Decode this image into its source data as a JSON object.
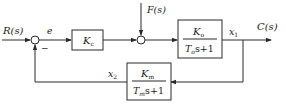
{
  "diagram": {
    "type": "control-system-block-diagram",
    "signals": {
      "input": "R(s)",
      "error": "e",
      "disturbance": "F(s)",
      "output": "C(s)",
      "x1": "x",
      "x1_sub": "1",
      "x2": "x",
      "x2_sub": "2",
      "minus_sign": "−"
    },
    "blocks": {
      "controller": {
        "num": "K",
        "num_sub": "c"
      },
      "plant": {
        "num": "K",
        "num_sub": "o",
        "den_T": "T",
        "den_T_sub": "o",
        "den_rest": "s+1"
      },
      "feedback": {
        "num": "K",
        "num_sub": "m",
        "den_T": "T",
        "den_T_sub": "m",
        "den_rest": "s+1"
      }
    },
    "colors": {
      "line": "#2a2a2a",
      "text": "#1a1a1a",
      "background": "#ffffff"
    }
  }
}
